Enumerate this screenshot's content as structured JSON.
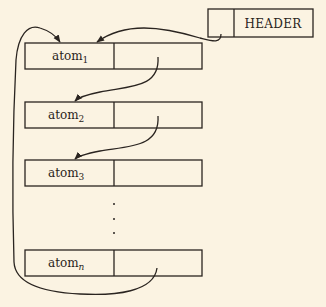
{
  "header": {
    "label": "HEADER"
  },
  "atoms": [
    {
      "base": "atom",
      "sub": "1"
    },
    {
      "base": "atom",
      "sub": "2"
    },
    {
      "base": "atom",
      "sub": "3"
    },
    {
      "base": "atom",
      "sub": "n"
    }
  ],
  "ellipsis": "⋮",
  "colors": {
    "background": "#fbf3e2",
    "ink": "#2a2420"
  }
}
